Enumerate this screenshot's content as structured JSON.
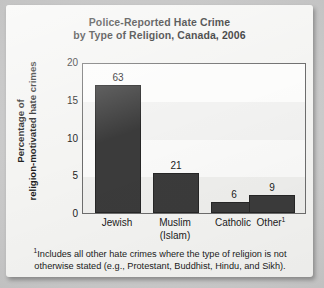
{
  "chart_data": {
    "type": "bar",
    "title": "Police-Reported Hate Crime by Type of Religion, Canada, 2006",
    "title_lines": [
      "Police-Reported Hate Crime",
      "by Type of Religion, Canada, 2006"
    ],
    "xlabel": "",
    "ylabel": "Percentage of religion-motivated hate crimes",
    "ylabel_lines": [
      "Percentage of",
      "religion-motivated hate crimes"
    ],
    "categories": [
      "Jewish",
      "Muslim (Islam)",
      "Catholic",
      "Other"
    ],
    "category_lines": [
      [
        "Jewish"
      ],
      [
        "Muslim",
        "(Islam)"
      ],
      [
        "Catholic"
      ],
      [
        "Other"
      ]
    ],
    "category_footnote_marker": [
      "",
      "",
      "",
      "1"
    ],
    "values": [
      17.2,
      5.4,
      1.5,
      2.4
    ],
    "value_labels": [
      "63",
      "21",
      "6",
      "9"
    ],
    "ylim": [
      0,
      20
    ],
    "yticks": [
      20,
      15,
      10,
      5,
      0
    ],
    "grid": false,
    "legend": "none",
    "bar_color": "#3b3b3b",
    "plot_border_color": "#6d6d6d",
    "text_color": "#1b1b1b",
    "card_color": "#f4f4f2",
    "page_background": "#c9c9c9"
  },
  "footnote": {
    "marker": "1",
    "lines": [
      "Includes all other hate crimes where the type of religion is not",
      "otherwise stated (e.g., Protestant, Buddhist, Hindu, and Sikh)."
    ],
    "text": "1Includes all other hate crimes where the type of religion is not otherwise stated (e.g., Protestant, Buddhist, Hindu, and Sikh)."
  }
}
